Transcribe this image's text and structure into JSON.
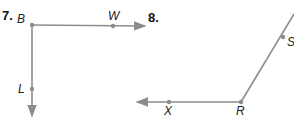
{
  "problems": [
    {
      "number": "7.",
      "vertex": "B",
      "points": [
        "W",
        "L"
      ],
      "rays": [
        "BW",
        "BL"
      ]
    },
    {
      "number": "8.",
      "vertex": "R",
      "points": [
        "S",
        "X"
      ],
      "rays": [
        "RS",
        "RX"
      ]
    }
  ],
  "colors": {
    "ray": "#8c8c8c",
    "text": "#222222"
  }
}
